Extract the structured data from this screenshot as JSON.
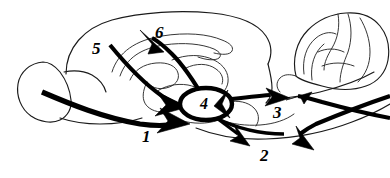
{
  "figure": {
    "type": "anatomical-pathway-diagram",
    "background_color": "#ffffff",
    "line_color": "#000000",
    "outline_color": "#1a1a1a",
    "width": 390,
    "height": 178
  },
  "labels": {
    "one": "1",
    "two": "2",
    "three": "3",
    "four": "4",
    "five": "5",
    "six": "6"
  },
  "structures": {
    "olfactory_bulb": "olfactory-bulb-outline",
    "cerebral_cortex": "cerebral-cortex-outline",
    "corpus_callosum": "corpus-callosum-outline",
    "subcortical": "subcortical-structures-outline",
    "cerebellum": "cerebellum-outline",
    "brainstem": "brainstem-outline",
    "hub": "central-hub-ellipse"
  },
  "pathways": [
    {
      "id": "1",
      "label": "1",
      "style": "heavy",
      "description": "rostral horizontal projection from olfactory bulb to hub"
    },
    {
      "id": "2",
      "label": "2",
      "style": "medium",
      "description": "two descending caudal projections from hub"
    },
    {
      "id": "3",
      "label": "3",
      "style": "medium",
      "description": "bidirectional caudal projection between hub and brainstem"
    },
    {
      "id": "4",
      "label": "4",
      "style": "hub",
      "description": "central relay nucleus"
    },
    {
      "id": "5",
      "label": "5",
      "style": "medium",
      "description": "descending cortical projection to hub"
    },
    {
      "id": "6",
      "label": "6",
      "style": "medium",
      "description": "ascending projection from hub to cortex"
    }
  ]
}
